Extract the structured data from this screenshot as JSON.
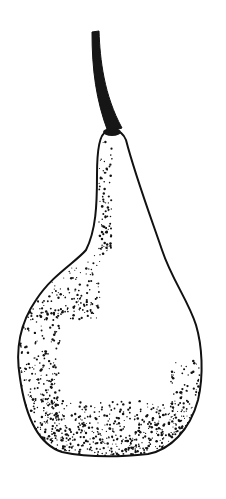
{
  "image": {
    "subject": "Pear",
    "style": "stippled pen-and-ink illustration",
    "width": 226,
    "height": 499,
    "background": "#ffffff",
    "ink": "#111111"
  },
  "shapes": {
    "stem": {
      "path": "M92,32 L99,31 C100,60 104,95 122,128 L108,132 C96,100 92,70 92,32 Z"
    },
    "body": {
      "path": "M106,132 C100,134 97,150 97,175 C97,205 96,230 86,250 C76,262 52,275 36,300 C18,326 16,355 20,378 C26,420 40,445 62,452 C90,458 120,457 148,454 C170,450 190,430 198,400 C204,375 202,345 196,325 C188,300 172,280 162,250 C150,215 135,175 126,140 C122,130 114,129 106,132 Z"
    },
    "stem_base": {
      "cx": 112,
      "cy": 132,
      "rx": 9,
      "ry": 4
    }
  },
  "stipple": {
    "seed": 7,
    "regions": [
      {
        "name": "left-neck",
        "x0": 99,
        "x1": 112,
        "y0": 140,
        "y1": 255,
        "count": 90
      },
      {
        "name": "left-shoulder",
        "x0": 30,
        "x1": 100,
        "y0": 255,
        "y1": 320,
        "count": 160
      },
      {
        "name": "left-side",
        "x0": 20,
        "x1": 60,
        "y0": 300,
        "y1": 430,
        "count": 230
      },
      {
        "name": "bottom",
        "x0": 40,
        "x1": 185,
        "y0": 400,
        "y1": 456,
        "count": 520
      },
      {
        "name": "right-lower",
        "x0": 170,
        "x1": 200,
        "y0": 360,
        "y1": 440,
        "count": 110
      }
    ]
  }
}
